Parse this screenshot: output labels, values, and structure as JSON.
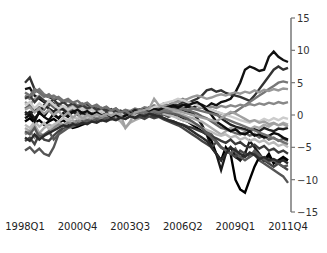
{
  "chart_data": {
    "type": "line",
    "title": "",
    "xlabel": "",
    "ylabel": "",
    "ylim": [
      -15,
      15
    ],
    "y_axis_position": "right",
    "y_ticks": [
      15,
      10,
      5,
      0,
      -5,
      -10,
      -15
    ],
    "x_tick_labels": [
      "1998Q1",
      "2000Q4",
      "2003Q3",
      "2006Q2",
      "2009Q1",
      "2011Q4"
    ],
    "x_tick_indices": [
      0,
      11,
      22,
      33,
      44,
      55
    ],
    "grid": false,
    "legend": "none",
    "n_quarters": 56,
    "series": [
      {
        "name": "s1",
        "color": "#111111",
        "values": [
          4,
          4.2,
          3,
          2.5,
          2,
          1.5,
          1.8,
          1.2,
          1,
          0.8,
          1.2,
          0.5,
          0.3,
          0.6,
          0.2,
          0,
          0.3,
          -0.2,
          0.1,
          0.4,
          0,
          -0.3,
          0.2,
          0.5,
          0.1,
          0.4,
          0.8,
          0.5,
          1,
          0.7,
          1.1,
          0.9,
          1.2,
          1,
          1.3,
          1.1,
          1.4,
          1.6,
          1.2,
          1.8,
          1.5,
          2,
          2.2,
          2.5,
          3.5,
          5,
          7,
          7.5,
          7.2,
          6.8,
          7,
          9,
          9.8,
          9,
          8.5,
          8.2
        ]
      },
      {
        "name": "s2",
        "color": "#333333",
        "values": [
          5,
          5.8,
          4,
          3.5,
          3,
          2.8,
          2.4,
          2.6,
          2,
          2.2,
          1.8,
          1.5,
          1.2,
          1.6,
          1,
          1.2,
          0.8,
          1,
          0.6,
          0.8,
          0.5,
          0.7,
          0.4,
          0.6,
          0.9,
          0.7,
          1.2,
          1,
          1.3,
          1.5,
          1.2,
          1.7,
          1.5,
          2,
          1.8,
          2.2,
          2.5,
          3,
          3.8,
          4,
          3.6,
          3.8,
          3.4,
          3.2,
          3,
          2.8,
          2.5,
          2.2,
          3,
          4,
          5,
          6,
          7,
          7.5,
          7,
          7.3
        ]
      },
      {
        "name": "s3",
        "color": "#555555",
        "values": [
          -5.5,
          -5,
          -5.8,
          -5.2,
          -6,
          -6.3,
          -5,
          -3,
          -2,
          -1.5,
          -1.2,
          -0.8,
          -1,
          -0.5,
          -0.8,
          -0.3,
          -0.6,
          -0.2,
          -0.5,
          0,
          -0.3,
          -0.1,
          0.2,
          0,
          -0.2,
          0.1,
          0.3,
          0,
          -0.2,
          0.1,
          -0.3,
          0,
          -0.5,
          -0.8,
          -1,
          -1.2,
          -1.5,
          -2,
          -2.5,
          -3,
          -4,
          -5,
          -5.5,
          -5,
          -6,
          -7,
          -5.8,
          -6.5,
          -6,
          -7,
          -7.5,
          -8,
          -8.5,
          -9,
          -9.5,
          -10.5
        ]
      },
      {
        "name": "s4",
        "color": "#1a1a1a",
        "values": [
          0,
          0.5,
          -0.5,
          0.3,
          -0.2,
          0.8,
          0,
          -0.5,
          0.2,
          -0.3,
          0.5,
          0,
          -0.2,
          0.3,
          -0.3,
          0.1,
          0.4,
          -0.1,
          0.2,
          -0.2,
          0.3,
          0,
          0.5,
          0.2,
          0.6,
          0.3,
          0.8,
          0.5,
          1,
          0.7,
          0.9,
          1.2,
          1,
          0.8,
          0.5,
          0.3,
          -0.5,
          -1.5,
          -3,
          -5,
          -6,
          -8.5,
          -6,
          -5,
          -6.5,
          -7,
          -6,
          -4,
          -5,
          -6,
          -7,
          -6.5,
          -7,
          -7.5,
          -6.8,
          -7
        ]
      },
      {
        "name": "s5",
        "color": "#000000",
        "values": [
          -1,
          -0.5,
          -1.2,
          -0.8,
          -1.5,
          -1,
          -0.6,
          -1.2,
          -0.8,
          -1.5,
          -2,
          -1.8,
          -1.5,
          -1.2,
          -0.8,
          -1,
          -0.5,
          -0.8,
          -0.3,
          -0.6,
          -0.2,
          -0.5,
          0,
          -0.3,
          0.2,
          0,
          0.4,
          0.2,
          0.6,
          0.3,
          0.5,
          0.2,
          0,
          -0.5,
          -1,
          -1.5,
          -2,
          -2.5,
          -3,
          -4,
          -6,
          -7,
          -5,
          -6,
          -10,
          -11.5,
          -12,
          -10,
          -8,
          -6.5,
          -7,
          -6,
          -7.5,
          -7,
          -6.5,
          -7
        ]
      },
      {
        "name": "s6",
        "color": "#777777",
        "values": [
          3,
          2.5,
          3.5,
          4,
          3.2,
          2.8,
          3,
          2.5,
          2,
          2.2,
          1.8,
          1.5,
          1.8,
          1.2,
          1,
          1.4,
          0.8,
          1.2,
          0.6,
          1,
          0.4,
          0.8,
          0.6,
          1,
          0.8,
          1.2,
          1,
          1.5,
          1.2,
          1.8,
          1.5,
          2,
          2.2,
          2.5,
          2,
          1.8,
          1.5,
          1.2,
          1,
          0.8,
          0.5,
          0.2,
          0,
          0.3,
          0.5,
          1,
          1.5,
          2,
          2.5,
          3,
          3.5,
          4,
          4.5,
          5,
          5.2,
          5
        ]
      },
      {
        "name": "s7",
        "color": "#999999",
        "values": [
          2,
          1.5,
          2.5,
          3,
          2.2,
          2,
          1.5,
          1.8,
          1.2,
          1,
          1.4,
          0.8,
          1.2,
          0.6,
          0.9,
          0.4,
          0.7,
          0.2,
          0.5,
          0,
          0.3,
          -0.2,
          0.1,
          -0.1,
          0.3,
          0.5,
          0.8,
          1,
          1.2,
          1.5,
          1.3,
          1.8,
          2,
          2.3,
          2.5,
          2.8,
          3,
          2.8,
          2.5,
          2.7,
          3,
          3.2,
          3,
          3.3,
          3.5,
          3.3,
          3.6,
          3.4,
          3.8,
          3.5,
          3.9,
          3.7,
          4,
          3.8,
          4.1,
          4
        ]
      },
      {
        "name": "s8",
        "color": "#aaaaaa",
        "values": [
          -2,
          -2.5,
          -1.5,
          -2.8,
          -2,
          -1.5,
          -1.8,
          -1.2,
          -1.5,
          -1,
          -0.8,
          -1.2,
          -0.5,
          -0.8,
          -0.3,
          -0.6,
          0,
          -0.4,
          -0.1,
          -0.5,
          -1,
          -2,
          -1.2,
          -0.8,
          -0.5,
          -0.2,
          0,
          0.2,
          0.5,
          0.3,
          0.6,
          0.4,
          0.2,
          0,
          -0.3,
          -0.5,
          -0.8,
          -1,
          -1.5,
          -2,
          -2.5,
          -3,
          -2.5,
          -2,
          -2.3,
          -2.1,
          -2.5,
          -2.2,
          -1.8,
          -2,
          -1.5,
          -1.8,
          -1.3,
          -1.6,
          -1.2,
          -1.5
        ]
      },
      {
        "name": "s9",
        "color": "#444444",
        "values": [
          -4,
          -3.5,
          -4.5,
          -3,
          -3.8,
          -4,
          -3.2,
          -2.5,
          -2,
          -1.8,
          -1.5,
          -1.2,
          -1,
          -1.3,
          -0.8,
          -1.1,
          -0.6,
          -0.9,
          -0.4,
          -0.7,
          -0.3,
          -0.6,
          -0.2,
          -0.5,
          -0.3,
          -0.6,
          -0.2,
          -0.5,
          -0.3,
          -0.7,
          -1,
          -1.3,
          -1.6,
          -2,
          -2.5,
          -3,
          -3.5,
          -4,
          -4.5,
          -5,
          -4.2,
          -5,
          -5.5,
          -6,
          -6.5,
          -5.5,
          -6,
          -6.2,
          -5.8,
          -6.5,
          -7,
          -7.5,
          -8,
          -7.5,
          -8,
          -8.5
        ]
      },
      {
        "name": "s10",
        "color": "#666666",
        "values": [
          1,
          1.5,
          0.5,
          1.2,
          0.8,
          1.8,
          1.2,
          0.6,
          1,
          0.4,
          0.8,
          0.2,
          0.5,
          0,
          0.3,
          -0.2,
          0.1,
          -0.3,
          0,
          -0.5,
          -0.2,
          0.2,
          0,
          0.3,
          0.1,
          0.4,
          0.2,
          0.5,
          0.3,
          0.6,
          0.8,
          1,
          1.2,
          1,
          0.8,
          0.5,
          0.2,
          -0.2,
          -0.5,
          -1,
          -1.5,
          -2,
          -2.2,
          -2.5,
          -2.8,
          -3,
          -2.7,
          -3.2,
          -2.9,
          -3.5,
          -3.2,
          -3.8,
          -3.5,
          -4,
          -3.7,
          -4
        ]
      },
      {
        "name": "s11",
        "color": "#222222",
        "values": [
          0.5,
          0,
          1,
          0.3,
          1.5,
          1,
          0.5,
          1.2,
          0.8,
          0.2,
          0.6,
          0,
          0.3,
          -0.3,
          0,
          -0.5,
          -0.2,
          0.3,
          0,
          0.5,
          0.2,
          0.6,
          0.3,
          0.8,
          0.5,
          0.9,
          0.6,
          1,
          0.8,
          1.2,
          1,
          1.3,
          1.1,
          1.5,
          1.7,
          1.9,
          1.5,
          1.2,
          0.8,
          0.5,
          0.2,
          -0.5,
          -1,
          -1.5,
          -1.8,
          -2,
          -2.2,
          -2.5,
          -2.2,
          -2.5,
          -2,
          -2.3,
          -2.5,
          -2.1,
          -2.2,
          -2
        ]
      },
      {
        "name": "s12",
        "color": "#888888",
        "values": [
          -3,
          -2.5,
          -3.5,
          -2.8,
          -3.2,
          -2.5,
          -2,
          -1.5,
          -1.8,
          -1.2,
          -1.5,
          -0.9,
          -1.2,
          -0.6,
          -0.9,
          -0.3,
          -0.6,
          0,
          -0.3,
          0.2,
          -0.1,
          0.3,
          0,
          0.4,
          0.1,
          0.5,
          0.2,
          0.6,
          0.4,
          0.8,
          0.6,
          0.9,
          0.7,
          1,
          0.8,
          1.1,
          0.9,
          1.2,
          1,
          1.3,
          1.1,
          1.4,
          1.2,
          1.5,
          1.3,
          1.6,
          1.4,
          1.7,
          1.5,
          1.8,
          1.6,
          1.9,
          1.7,
          2,
          1.8,
          2
        ]
      },
      {
        "name": "s13",
        "color": "#bbbbbb",
        "values": [
          -1.5,
          -2,
          -1,
          -1.8,
          -1.2,
          -2.2,
          -1.5,
          -1,
          -0.5,
          -0.8,
          -0.3,
          -0.6,
          -0.1,
          -0.4,
          0.1,
          -0.2,
          0.2,
          -0.1,
          0.3,
          0,
          0.4,
          0.1,
          0.5,
          0.2,
          0.6,
          0.3,
          0.7,
          0.4,
          0.5,
          0.2,
          0,
          -0.2,
          -0.5,
          -0.8,
          -1,
          -1.3,
          -1.6,
          -2,
          -2.3,
          -2.6,
          -3,
          -3.2,
          -3,
          -3.5,
          -3.2,
          -3.8,
          -3.5,
          -4,
          -3.7,
          -4.2,
          -3.9,
          -4.5,
          -4.2,
          -4.8,
          -4.5,
          -5
        ]
      },
      {
        "name": "s14",
        "color": "#3a3a3a",
        "values": [
          2.5,
          3,
          2,
          2.8,
          2.2,
          1.8,
          2.4,
          1.6,
          2,
          1.4,
          1.8,
          1.2,
          1.5,
          1,
          1.3,
          0.8,
          1.1,
          0.6,
          0.9,
          0.4,
          0.7,
          0.2,
          0.5,
          0,
          0.3,
          -0.2,
          0.1,
          -0.3,
          0,
          -0.5,
          -0.8,
          -1,
          -1.3,
          -1.5,
          -1.8,
          -2,
          -2.3,
          -2.6,
          -3,
          -3.3,
          -3.6,
          -4,
          -4.3,
          -3.8,
          -4.5,
          -4.2,
          -4.8,
          -5,
          -4.6,
          -5.2,
          -4.8,
          -5.5,
          -5.2,
          -5.8,
          -5.5,
          -6
        ]
      },
      {
        "name": "s15",
        "color": "#5a5a5a",
        "values": [
          -2.5,
          -3,
          -2,
          -3.5,
          -3,
          -2.5,
          -3.8,
          -3,
          -2.5,
          -2,
          -1.8,
          -1.5,
          -1.2,
          -0.8,
          -1,
          -0.6,
          -0.9,
          -0.4,
          -0.7,
          -0.2,
          -0.5,
          0,
          -0.3,
          0.2,
          -0.1,
          0.3,
          0,
          0.4,
          0.2,
          0.5,
          0.3,
          0.2,
          0,
          -0.3,
          -0.6,
          -1,
          -1.5,
          -2,
          -2.8,
          -3.5,
          -4.2,
          -5,
          -5.5,
          -6,
          -5.2,
          -6.5,
          -7,
          -6.5,
          -5.5,
          -6.2,
          -6.8,
          -7.2,
          -7,
          -7.5,
          -8,
          -7.8
        ]
      },
      {
        "name": "s16",
        "color": "#cccccc",
        "values": [
          1.5,
          2,
          1,
          1.8,
          1.2,
          2.2,
          1.6,
          1,
          1.4,
          0.8,
          1.2,
          0.6,
          1,
          0.4,
          0.8,
          0.2,
          0.6,
          0,
          0.4,
          -0.2,
          0.2,
          -0.4,
          0,
          -0.2,
          0.2,
          0.5,
          0.8,
          1.2,
          1.5,
          1.8,
          2,
          2.2,
          2.5,
          2.3,
          2,
          1.8,
          1.5,
          1.3,
          1,
          0.8,
          0.5,
          0.3,
          0,
          -0.2,
          -0.5,
          -0.8,
          -1,
          -1.2,
          -0.8,
          -1,
          -0.6,
          -0.9,
          -0.5,
          -0.8,
          -0.4,
          -0.6
        ]
      },
      {
        "name": "s17",
        "color": "#0d0d0d",
        "values": [
          -0.5,
          0,
          -1,
          0.5,
          -0.3,
          -0.8,
          0.2,
          -0.5,
          0.3,
          -0.2,
          0.5,
          0.8,
          0.3,
          0.6,
          0.1,
          0.4,
          -0.1,
          0.2,
          -0.3,
          0,
          -0.4,
          -0.1,
          0.2,
          0.5,
          0.3,
          0.7,
          0.5,
          0.9,
          0.7,
          1.1,
          1.3,
          1.5,
          1.2,
          1.6,
          1.4,
          1.8,
          2,
          1.5,
          0.8,
          0,
          -1,
          -1.5,
          -2,
          -2.5,
          -2.2,
          -2.8,
          -3,
          -2.5,
          -3.2,
          -3,
          -3.5,
          -3.2,
          -2.8,
          -3,
          -3.5,
          -3.8
        ]
      },
      {
        "name": "s18",
        "color": "#727272",
        "values": [
          3.5,
          3,
          4,
          3.5,
          2.8,
          3.2,
          2.5,
          2.8,
          2.2,
          2.5,
          1.9,
          2.2,
          1.6,
          1.9,
          1.3,
          1.6,
          1,
          1.3,
          0.7,
          1,
          0.4,
          0.7,
          0.1,
          0.4,
          0.2,
          0.5,
          0.3,
          0.6,
          0.4,
          0.7,
          0.5,
          0.8,
          0.6,
          0.9,
          0.7,
          1,
          0.8,
          0.6,
          0.4,
          0.2,
          0,
          -0.3,
          -0.6,
          -0.9,
          -1.2,
          -1.5,
          -1.8,
          -2.1,
          -2.4,
          -2.7,
          -3,
          -3.3,
          -3.6,
          -3.9,
          -4.2,
          -4.5
        ]
      },
      {
        "name": "s19",
        "color": "#a0a0a0",
        "values": [
          0.8,
          1.2,
          0.4,
          1,
          0.2,
          0.8,
          0,
          0.6,
          -0.2,
          0.4,
          -0.4,
          0.2,
          -0.6,
          0,
          -0.3,
          0.1,
          -0.2,
          0.2,
          -0.1,
          0.3,
          0,
          -2,
          -1,
          0.4,
          0.6,
          0.8,
          1,
          2.5,
          1.5,
          1.2,
          1,
          0.8,
          0.6,
          0.4,
          0.2,
          0,
          -0.2,
          -0.4,
          -0.6,
          -0.8,
          -1,
          -0.5,
          0,
          0.5,
          0.2,
          -0.2,
          -0.6,
          -1,
          -0.8,
          -1.2,
          -1,
          -1.4,
          -1.2,
          -1.6,
          -1.4,
          -1.8
        ]
      },
      {
        "name": "s20",
        "color": "#2b2b2b",
        "values": [
          -3.5,
          -4,
          -3,
          -3.8,
          -3.2,
          -2.8,
          -2.4,
          -2,
          -1.6,
          -1.8,
          -1.4,
          -1.6,
          -1.2,
          -1.4,
          -1,
          -1.2,
          -0.8,
          -1,
          -0.6,
          -0.8,
          -0.4,
          -0.6,
          -0.2,
          -0.4,
          0,
          -0.2,
          0.2,
          0,
          -0.2,
          -0.5,
          -0.8,
          -1,
          -1.3,
          -1.6,
          -2,
          -2.5,
          -3,
          -3.5,
          -4,
          -5,
          -6,
          -7,
          -6,
          -5,
          -5.5,
          -6,
          -6.5,
          -5.8,
          -6.2,
          -6.8,
          -6.5,
          -7,
          -6.8,
          -7.2,
          -7,
          -7.5
        ]
      }
    ]
  }
}
